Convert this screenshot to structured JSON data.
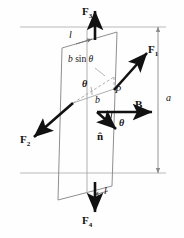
{
  "figure": {
    "colors": {
      "ink": "#111111",
      "loop_stroke": "#8a8a8a",
      "guide_stroke": "#b0b0b0",
      "dim_stroke": "#8a8a8a",
      "background": "#fefefe"
    }
  },
  "labels": {
    "force_top": "F",
    "force_top_sub": "3",
    "force_bottom": "F",
    "force_bottom_sub": "4",
    "force_right": "F",
    "force_right_sub": "1",
    "force_left": "F",
    "force_left_sub": "2",
    "side_top": "l",
    "side_bottom": "l",
    "width_b": "b",
    "projection": "b sin θ",
    "projection_b": "b",
    "projection_fn": "sin",
    "projection_theta": "θ",
    "angle_plane": "θ",
    "angle_field": "θ",
    "point_p": "P",
    "field": "B",
    "normal": "n̂",
    "dimension_a": "a"
  },
  "vectors": [
    {
      "name": "F3",
      "label": "F₃",
      "direction": "up",
      "tail": [
        95,
        38
      ],
      "head": [
        95,
        10
      ]
    },
    {
      "name": "F4",
      "label": "F₄",
      "direction": "down",
      "tail": [
        95,
        182
      ],
      "head": [
        95,
        213
      ]
    },
    {
      "name": "F1",
      "label": "F₁",
      "direction": "up-right",
      "tail": [
        115,
        90
      ],
      "head": [
        148,
        52
      ]
    },
    {
      "name": "F2",
      "label": "F₂",
      "direction": "down-left",
      "tail": [
        73,
        103
      ],
      "head": [
        33,
        138
      ]
    },
    {
      "name": "B",
      "label": "B",
      "direction": "right",
      "tail": [
        97,
        112
      ],
      "head": [
        155,
        112
      ]
    },
    {
      "name": "n",
      "label": "n̂",
      "direction": "down-right",
      "tail": [
        97,
        112
      ],
      "head": [
        118,
        131
      ]
    }
  ],
  "geometry": {
    "loop_vertices": "parallelogram: top-left (62,48), top-right (117,32), bottom-right (112,186), bottom-left (58,200)",
    "reference_lines_y": [
      27,
      173
    ],
    "dimension_label": "a",
    "dimension_span_y": [
      27,
      173
    ]
  }
}
